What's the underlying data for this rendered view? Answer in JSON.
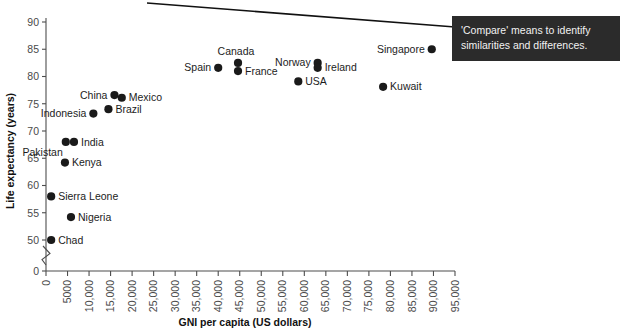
{
  "callout": {
    "line1": "'Compare' means to identify",
    "line2": "similarities and differences.",
    "background": "#2b2b2b",
    "text_color": "#f2f2f2"
  },
  "chart_data": {
    "type": "scatter",
    "title": "",
    "xlabel": "GNI per capita (US dollars)",
    "ylabel": "Life expectancy (years)",
    "xlim": [
      0,
      95000
    ],
    "ylim": [
      0,
      90
    ],
    "y_axis_break": true,
    "y_break_note": "axis break between 0 and 50",
    "grid": false,
    "legend": "none",
    "xticks": [
      "0",
      "5000",
      "10,000",
      "15,000",
      "20,000",
      "25,000",
      "30,000",
      "35,000",
      "40,000",
      "45,000",
      "50,000",
      "55,000",
      "60,000",
      "65,000",
      "70,000",
      "75,000",
      "80,000",
      "85,000",
      "90,000",
      "95,000"
    ],
    "xtick_values": [
      0,
      5000,
      10000,
      15000,
      20000,
      25000,
      30000,
      35000,
      40000,
      45000,
      50000,
      55000,
      60000,
      65000,
      70000,
      75000,
      80000,
      85000,
      90000,
      95000
    ],
    "yticks": [
      "0",
      "50",
      "55",
      "60",
      "65",
      "70",
      "75",
      "80",
      "85",
      "90"
    ],
    "ytick_values": [
      0,
      50,
      55,
      60,
      65,
      70,
      75,
      80,
      85,
      90
    ],
    "point_color": "#1a1a1a",
    "points": [
      {
        "name": "Chad",
        "x": 1200,
        "y": 50.0,
        "label_pos": "right"
      },
      {
        "name": "Sierra Leone",
        "x": 1200,
        "y": 58.0,
        "label_pos": "right"
      },
      {
        "name": "Nigeria",
        "x": 5800,
        "y": 54.2,
        "label_pos": "right"
      },
      {
        "name": "Kenya",
        "x": 4400,
        "y": 64.2,
        "label_pos": "right"
      },
      {
        "name": "Pakistan",
        "x": 4600,
        "y": 68.0,
        "label_pos": "below-left"
      },
      {
        "name": "India",
        "x": 6500,
        "y": 68.0,
        "label_pos": "right"
      },
      {
        "name": "Indonesia",
        "x": 11000,
        "y": 73.2,
        "label_pos": "left"
      },
      {
        "name": "Brazil",
        "x": 14500,
        "y": 74.0,
        "label_pos": "right"
      },
      {
        "name": "China",
        "x": 15900,
        "y": 76.6,
        "label_pos": "left"
      },
      {
        "name": "Mexico",
        "x": 17600,
        "y": 76.1,
        "label_pos": "right"
      },
      {
        "name": "Spain",
        "x": 40000,
        "y": 81.6,
        "label_pos": "left"
      },
      {
        "name": "Canada",
        "x": 44600,
        "y": 82.5,
        "label_pos": "above"
      },
      {
        "name": "France",
        "x": 44600,
        "y": 81.0,
        "label_pos": "right"
      },
      {
        "name": "USA",
        "x": 58600,
        "y": 79.1,
        "label_pos": "right"
      },
      {
        "name": "Norway",
        "x": 63100,
        "y": 82.5,
        "label_pos": "left"
      },
      {
        "name": "Ireland",
        "x": 63100,
        "y": 81.6,
        "label_pos": "right"
      },
      {
        "name": "Kuwait",
        "x": 78300,
        "y": 78.1,
        "label_pos": "right"
      },
      {
        "name": "Singapore",
        "x": 89600,
        "y": 85.0,
        "label_pos": "left"
      }
    ]
  }
}
